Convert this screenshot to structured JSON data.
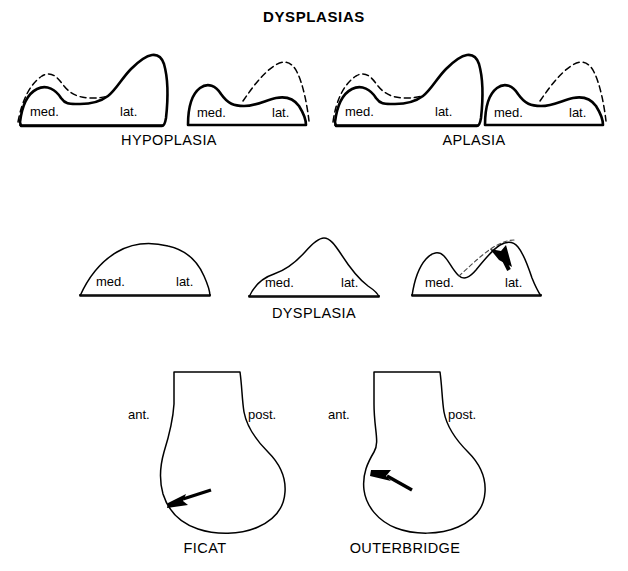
{
  "figure": {
    "title": "DYSPLASIAS",
    "background_color": "#ffffff",
    "line_color": "#000000"
  },
  "rows": [
    {
      "row_name": "upper-row",
      "group_labels": [
        "HYPOPLASIA",
        "APLASIA"
      ],
      "shapes": [
        {
          "id": "hypoplasia-1",
          "medial_label": "med.",
          "lateral_label": "lat.",
          "has_dashed_overlay": true,
          "dashed_side": "medial",
          "has_arrow": false
        },
        {
          "id": "hypoplasia-2",
          "medial_label": "med.",
          "lateral_label": "lat.",
          "has_dashed_overlay": true,
          "dashed_side": "lateral",
          "has_arrow": false
        },
        {
          "id": "aplasia-1",
          "medial_label": "med.",
          "lateral_label": "lat.",
          "has_dashed_overlay": true,
          "dashed_side": "medial",
          "has_arrow": false
        },
        {
          "id": "aplasia-2",
          "medial_label": "med.",
          "lateral_label": "lat.",
          "has_dashed_overlay": true,
          "dashed_side": "lateral",
          "has_arrow": false
        }
      ]
    },
    {
      "row_name": "middle-row",
      "group_labels": [
        "DYSPLASIA"
      ],
      "shapes": [
        {
          "id": "dysplasia-1",
          "medial_label": "med.",
          "lateral_label": "lat.",
          "has_dashed_overlay": false,
          "has_arrow": false
        },
        {
          "id": "dysplasia-2",
          "medial_label": "med.",
          "lateral_label": "lat.",
          "has_dashed_overlay": false,
          "has_arrow": false
        },
        {
          "id": "dysplasia-3",
          "medial_label": "med.",
          "lateral_label": "lat.",
          "has_dashed_overlay": true,
          "dashed_side": "lateral-slope",
          "has_arrow": true
        }
      ]
    },
    {
      "row_name": "lower-row",
      "shapes": [
        {
          "id": "ficat",
          "name_label": "FICAT",
          "anterior_label": "ant.",
          "posterior_label": "post.",
          "has_arrow": true,
          "arrow_target": "anterior-inferior"
        },
        {
          "id": "outerbridge",
          "name_label": "OUTERBRIDGE",
          "anterior_label": "ant.",
          "posterior_label": "post.",
          "has_arrow": true,
          "arrow_target": "anterior-notch"
        }
      ]
    }
  ],
  "labels": {
    "title": "DYSPLASIAS",
    "hypoplasia": "HYPOPLASIA",
    "aplasia": "APLASIA",
    "dysplasia": "DYSPLASIA",
    "ficat": "FICAT",
    "outerbridge": "OUTERBRIDGE",
    "med": "med.",
    "lat": "lat.",
    "ant": "ant.",
    "post": "post."
  }
}
